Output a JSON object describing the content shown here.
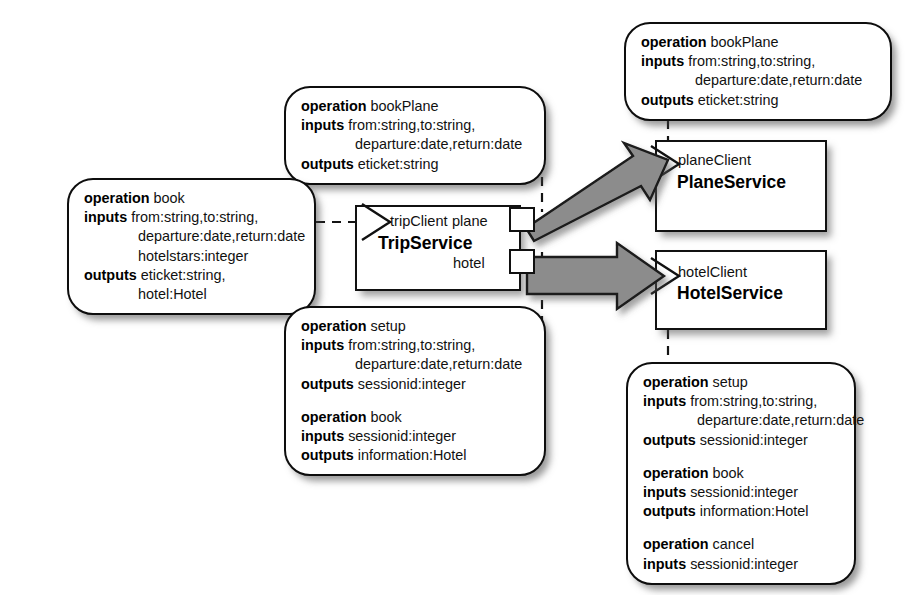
{
  "diagram": {
    "type": "uml-component-diagram",
    "colors": {
      "stroke": "#111111",
      "fill": "#ffffff",
      "arrow_fill": "#8c8c8c",
      "arrow_stroke": "#111111",
      "shadow": "rgba(70,70,70,0.55)"
    }
  },
  "components": [
    {
      "id": "trip-service",
      "name": "TripService",
      "provided_interface": "tripClient",
      "required_ports": [
        "plane",
        "hotel"
      ]
    },
    {
      "id": "plane-service",
      "name": "PlaneService",
      "provided_interface": "planeClient",
      "required_ports": []
    },
    {
      "id": "hotel-service",
      "name": "HotelService",
      "provided_interface": "hotelClient",
      "required_ports": []
    }
  ],
  "notes": {
    "trip_provided": {
      "id": "note-trip-book",
      "attached_to": "tripClient",
      "operations": [
        {
          "keyword_operation": "operation",
          "name": "book",
          "keyword_inputs": "inputs",
          "inputs_lines": [
            "from:string,to:string,",
            "departure:date,return:date",
            "hotelstars:integer"
          ],
          "keyword_outputs": "outputs",
          "outputs_lines": [
            "eticket:string,",
            "hotel:Hotel"
          ]
        }
      ]
    },
    "trip_plane_required": {
      "id": "note-trip-plane",
      "attached_to": "plane",
      "operations": [
        {
          "keyword_operation": "operation",
          "name": "bookPlane",
          "keyword_inputs": "inputs",
          "inputs_lines": [
            "from:string,to:string,",
            "departure:date,return:date"
          ],
          "keyword_outputs": "outputs",
          "outputs_lines": [
            "eticket:string"
          ]
        }
      ]
    },
    "trip_hotel_required": {
      "id": "note-trip-hotel",
      "attached_to": "hotel",
      "operations": [
        {
          "keyword_operation": "operation",
          "name": "setup",
          "keyword_inputs": "inputs",
          "inputs_lines": [
            "from:string,to:string,",
            "departure:date,return:date"
          ],
          "keyword_outputs": "outputs",
          "outputs_lines": [
            "sessionid:integer"
          ]
        },
        {
          "keyword_operation": "operation",
          "name": "book",
          "keyword_inputs": "inputs",
          "inputs_lines": [
            "sessionid:integer"
          ],
          "keyword_outputs": "outputs",
          "outputs_lines": [
            "information:Hotel"
          ]
        }
      ]
    },
    "plane_provided": {
      "id": "note-plane-service",
      "attached_to": "planeClient",
      "operations": [
        {
          "keyword_operation": "operation",
          "name": "bookPlane",
          "keyword_inputs": "inputs",
          "inputs_lines": [
            "from:string,to:string,",
            "departure:date,return:date"
          ],
          "keyword_outputs": "outputs",
          "outputs_lines": [
            "eticket:string"
          ]
        }
      ]
    },
    "hotel_provided": {
      "id": "note-hotel-service",
      "attached_to": "hotelClient",
      "operations": [
        {
          "keyword_operation": "operation",
          "name": "setup",
          "keyword_inputs": "inputs",
          "inputs_lines": [
            "from:string,to:string,",
            "departure:date,return:date"
          ],
          "keyword_outputs": "outputs",
          "outputs_lines": [
            "sessionid:integer"
          ]
        },
        {
          "keyword_operation": "operation",
          "name": "book",
          "keyword_inputs": "inputs",
          "inputs_lines": [
            "sessionid:integer"
          ],
          "keyword_outputs": "outputs",
          "outputs_lines": [
            "information:Hotel"
          ]
        },
        {
          "keyword_operation": "operation",
          "name": "cancel",
          "keyword_inputs": "inputs",
          "inputs_lines": [
            "sessionid:integer"
          ],
          "keyword_outputs": "",
          "outputs_lines": []
        }
      ]
    }
  },
  "connectors": [
    {
      "id": "plane-port-to-plane-service",
      "from": "plane",
      "to": "planeClient",
      "style": "assembly-arrow"
    },
    {
      "id": "hotel-port-to-hotel-service",
      "from": "hotel",
      "to": "hotelClient",
      "style": "assembly-arrow"
    }
  ]
}
